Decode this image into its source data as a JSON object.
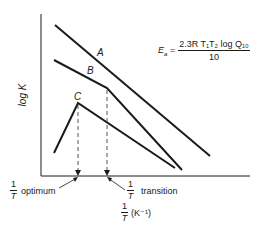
{
  "diagram": {
    "type": "arrhenius-plot",
    "y_axis_label": "log K",
    "x_axis_label": {
      "numerator": "1",
      "denominator": "T",
      "unit": "(K⁻¹)"
    },
    "curves": [
      {
        "name": "A",
        "label": "A",
        "shape": "straight line",
        "points": [
          [
            55,
            25
          ],
          [
            210,
            156
          ]
        ]
      },
      {
        "name": "B",
        "label": "B",
        "shape": "line with break (transition)",
        "points": [
          [
            54,
            60
          ],
          [
            107,
            88
          ],
          [
            182,
            170
          ]
        ]
      },
      {
        "name": "C",
        "label": "C",
        "shape": "rise then fall (optimum)",
        "points": [
          [
            54,
            153
          ],
          [
            78,
            103
          ],
          [
            175,
            168
          ]
        ]
      }
    ],
    "markers": [
      {
        "name": "optimum",
        "label": "optimum",
        "numerator": "1",
        "denominator": "T",
        "x": 78
      },
      {
        "name": "transition",
        "label": "transition",
        "numerator": "1",
        "denominator": "T",
        "x": 107
      }
    ],
    "equation": {
      "lhs": "E",
      "lhs_sub": "a",
      "numerator": "2.3R T₁T₂ log Q₁₀",
      "denominator": "10"
    },
    "colors": {
      "ink": "#1a1a1a",
      "dashed": "#555555",
      "background": "#ffffff"
    }
  }
}
